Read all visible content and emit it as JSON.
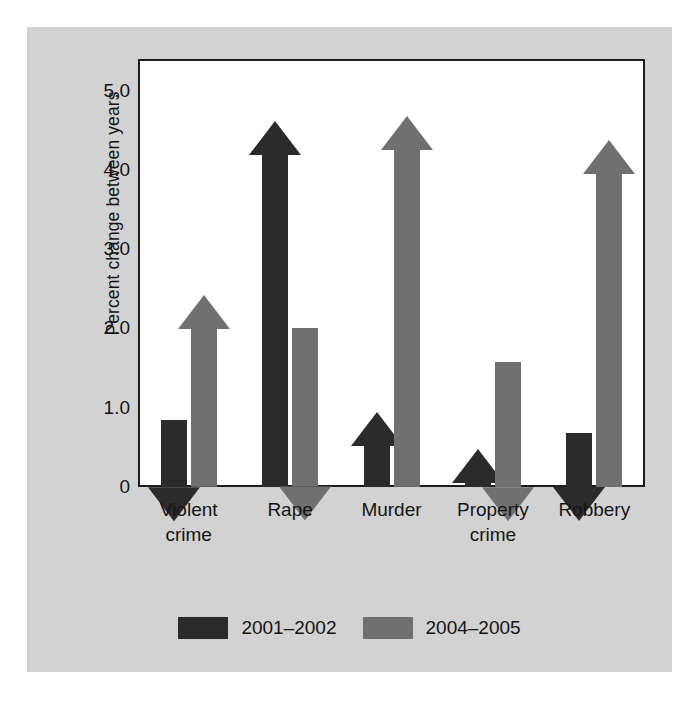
{
  "chart_data": {
    "type": "bar",
    "title": "",
    "subtitle": "",
    "xlabel": "",
    "ylabel": "Percent change between years",
    "categories": [
      "Violent\ncrime",
      "Rape",
      "Murder",
      "Property\ncrime",
      "Robbery"
    ],
    "category_lines": [
      [
        "Violent",
        "crime"
      ],
      [
        "Rape"
      ],
      [
        "Murder"
      ],
      [
        "Property",
        "crime"
      ],
      [
        "Robbery"
      ]
    ],
    "ylim": [
      0,
      5.4
    ],
    "yticks": [
      0,
      1.0,
      2.0,
      3.0,
      4.0,
      5.0
    ],
    "ytick_labels": [
      "0",
      "1.0",
      "2.0",
      "3.0",
      "4.0",
      "5.0"
    ],
    "grid": false,
    "legend_position": "bottom",
    "series": [
      {
        "name": "2001–2002",
        "color": "#2b2b2b",
        "values": [
          0.85,
          4.3,
          0.55,
          0.1,
          0.68
        ],
        "arrow_tip_values": [
          null,
          4.62,
          0.95,
          0.48,
          null
        ],
        "arrow_directions": [
          "down",
          "up",
          "up",
          "up",
          "down"
        ]
      },
      {
        "name": "2004–2005",
        "color": "#707070",
        "values": [
          2.05,
          2.0,
          4.1,
          1.58,
          4.05
        ],
        "arrow_tip_values": [
          2.42,
          null,
          4.68,
          null,
          4.38
        ],
        "arrow_directions": [
          "up",
          "down",
          "up",
          "down",
          "up"
        ]
      }
    ]
  },
  "legend": {
    "items": [
      {
        "label": "2001–2002",
        "color": "#2b2b2b"
      },
      {
        "label": "2004–2005",
        "color": "#707070"
      }
    ]
  },
  "colors": {
    "series_2001_2002": "#2b2b2b",
    "series_2004_2005": "#707070",
    "panel_background": "#d2d2d2",
    "plot_background": "#ffffff",
    "axis": "#1c1c1c",
    "text": "#141414"
  }
}
